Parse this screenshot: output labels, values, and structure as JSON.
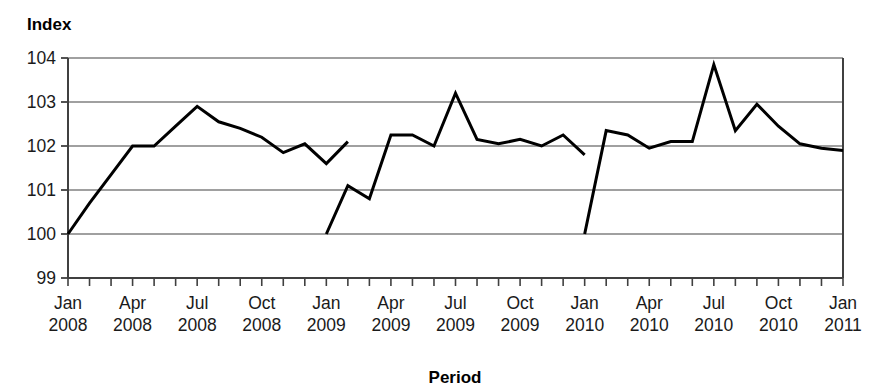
{
  "chart_data": {
    "type": "line",
    "title": "",
    "ylabel": "Index",
    "xlabel": "Period",
    "ylim": [
      99,
      104
    ],
    "yticks": [
      99,
      100,
      101,
      102,
      103,
      104
    ],
    "grid": true,
    "legend": "none",
    "x_tick_labels": [
      {
        "month": "Jan",
        "year": "2008"
      },
      {
        "month": "Apr",
        "year": "2008"
      },
      {
        "month": "Jul",
        "year": "2008"
      },
      {
        "month": "Oct",
        "year": "2008"
      },
      {
        "month": "Jan",
        "year": "2009"
      },
      {
        "month": "Apr",
        "year": "2009"
      },
      {
        "month": "Jul",
        "year": "2009"
      },
      {
        "month": "Oct",
        "year": "2009"
      },
      {
        "month": "Jan",
        "year": "2010"
      },
      {
        "month": "Apr",
        "year": "2010"
      },
      {
        "month": "Jul",
        "year": "2010"
      },
      {
        "month": "Oct",
        "year": "2010"
      },
      {
        "month": "Jan",
        "year": "2011"
      }
    ],
    "x_categories": [
      "Jan 2008",
      "Feb 2008",
      "Mar 2008",
      "Apr 2008",
      "May 2008",
      "Jun 2008",
      "Jul 2008",
      "Aug 2008",
      "Sep 2008",
      "Oct 2008",
      "Nov 2008",
      "Dec 2008",
      "Jan 2009",
      "Feb 2009",
      "Mar 2009",
      "Apr 2009",
      "May 2009",
      "Jun 2009",
      "Jul 2009",
      "Aug 2009",
      "Sep 2009",
      "Oct 2009",
      "Nov 2009",
      "Dec 2009",
      "Jan 2010",
      "Feb 2010",
      "Mar 2010",
      "Apr 2010",
      "May 2010",
      "Jun 2010",
      "Jul 2010",
      "Aug 2010",
      "Sep 2010",
      "Oct 2010",
      "Nov 2010",
      "Dec 2010",
      "Jan 2011"
    ],
    "series": [
      {
        "name": "2008 index series",
        "x_start_index": 0,
        "x_labels": [
          "Jan 2008",
          "Feb 2008",
          "Mar 2008",
          "Apr 2008",
          "May 2008",
          "Jun 2008",
          "Jul 2008",
          "Aug 2008",
          "Sep 2008",
          "Oct 2008",
          "Nov 2008",
          "Dec 2008",
          "Jan 2009"
        ],
        "values": [
          100.0,
          100.7,
          101.35,
          102.0,
          102.0,
          102.45,
          102.9,
          102.55,
          102.4,
          102.2,
          101.85,
          102.05,
          101.6,
          102.1
        ]
      },
      {
        "name": "2009 index series",
        "x_start_index": 12,
        "x_labels": [
          "Jan 2009",
          "Feb 2009",
          "Mar 2009",
          "Apr 2009",
          "May 2009",
          "Jun 2009",
          "Jul 2009",
          "Aug 2009",
          "Sep 2009",
          "Oct 2009",
          "Nov 2009",
          "Dec 2009"
        ],
        "values": [
          100.0,
          101.1,
          100.8,
          102.25,
          102.25,
          102.0,
          103.2,
          102.15,
          102.05,
          102.15,
          102.0,
          102.25,
          101.8
        ]
      },
      {
        "name": "2010 index series",
        "x_start_index": 24,
        "x_labels": [
          "Jan 2010",
          "Feb 2010",
          "Mar 2010",
          "Apr 2010",
          "May 2010",
          "Jun 2010",
          "Jul 2010",
          "Aug 2010",
          "Sep 2010",
          "Oct 2010",
          "Nov 2010",
          "Dec 2010",
          "Jan 2011"
        ],
        "values": [
          100.0,
          102.35,
          102.25,
          101.95,
          102.1,
          102.1,
          103.85,
          102.35,
          102.95,
          102.45,
          102.05,
          101.95,
          101.9
        ]
      }
    ],
    "line_color": "#000000",
    "grid_color": "#808080",
    "axis_color": "#404040"
  }
}
